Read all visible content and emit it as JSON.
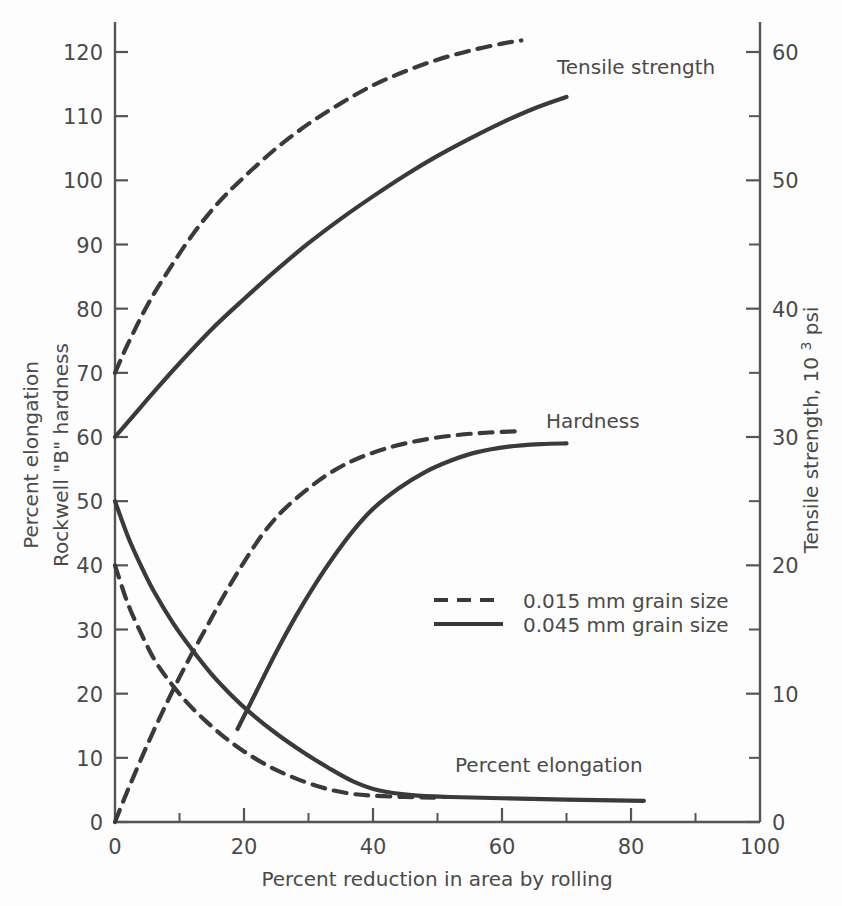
{
  "chart_data": {
    "type": "line",
    "title": "",
    "xlabel": "Percent reduction in area by rolling",
    "ylabel_left": "Percent elongation",
    "ylabel_left_2": "Rockwell \"B\" hardness",
    "ylabel_right": "Tensile strength,",
    "ylabel_right_unit_base": "10",
    "ylabel_right_unit_exp": "3",
    "ylabel_right_unit_tail": " psi",
    "xlim": [
      0,
      100
    ],
    "ylim_left": [
      0,
      124
    ],
    "ylim_right": [
      0,
      62
    ],
    "grid": false,
    "x_ticks": [
      0,
      20,
      40,
      60,
      80,
      100
    ],
    "x_minor_ticks": [
      10,
      30,
      50,
      70,
      90
    ],
    "y_ticks_left": [
      0,
      10,
      20,
      30,
      40,
      50,
      60,
      70,
      80,
      90,
      100,
      110,
      120
    ],
    "y_ticks_right": [
      0,
      10,
      20,
      30,
      40,
      50,
      60
    ],
    "y_minor_ticks_right": [
      5,
      15,
      25,
      35,
      45,
      55
    ],
    "legend_position": "center",
    "legend": [
      {
        "label": "0.015 mm grain size",
        "style": "dashed"
      },
      {
        "label": "0.045 mm grain size",
        "style": "solid"
      }
    ],
    "annotations": [
      {
        "text": "Tensile strength",
        "x": 63,
        "y": 117
      },
      {
        "text": "Hardness",
        "x": 66,
        "y": 62
      },
      {
        "text": "Percent elongation",
        "x": 53,
        "y": 8
      }
    ],
    "series": [
      {
        "name": "Tensile strength, 0.015 mm grain size",
        "style": "dashed",
        "axis": "left",
        "points": [
          [
            0,
            70
          ],
          [
            2,
            74.5
          ],
          [
            5,
            80.5
          ],
          [
            8,
            85.5
          ],
          [
            12,
            91.5
          ],
          [
            16,
            96.5
          ],
          [
            20,
            100.5
          ],
          [
            25,
            105.0
          ],
          [
            30,
            108.8
          ],
          [
            35,
            112.0
          ],
          [
            40,
            114.8
          ],
          [
            45,
            117.0
          ],
          [
            50,
            118.8
          ],
          [
            55,
            120.2
          ],
          [
            60,
            121.3
          ],
          [
            63,
            121.8
          ]
        ]
      },
      {
        "name": "Tensile strength, 0.045 mm grain size",
        "style": "solid",
        "axis": "left",
        "points": [
          [
            0,
            60
          ],
          [
            3,
            63.5
          ],
          [
            6,
            67.0
          ],
          [
            10,
            71.5
          ],
          [
            15,
            76.8
          ],
          [
            20,
            81.5
          ],
          [
            25,
            86.0
          ],
          [
            30,
            90.2
          ],
          [
            35,
            94.0
          ],
          [
            40,
            97.5
          ],
          [
            45,
            100.8
          ],
          [
            50,
            103.8
          ],
          [
            55,
            106.5
          ],
          [
            60,
            109.0
          ],
          [
            65,
            111.2
          ],
          [
            70,
            113.0
          ]
        ]
      },
      {
        "name": "Hardness, 0.015 mm grain size",
        "style": "dashed",
        "axis": "left",
        "points": [
          [
            0,
            0
          ],
          [
            2,
            5.0
          ],
          [
            5,
            12.0
          ],
          [
            8,
            18.5
          ],
          [
            11,
            24.5
          ],
          [
            14,
            30.0
          ],
          [
            17,
            35.5
          ],
          [
            20,
            40.5
          ],
          [
            23,
            45.0
          ],
          [
            26,
            48.5
          ],
          [
            30,
            52.0
          ],
          [
            34,
            54.8
          ],
          [
            38,
            56.8
          ],
          [
            43,
            58.5
          ],
          [
            48,
            59.6
          ],
          [
            53,
            60.3
          ],
          [
            58,
            60.7
          ],
          [
            63,
            60.9
          ]
        ]
      },
      {
        "name": "Hardness, 0.045 mm grain size",
        "style": "solid",
        "axis": "left",
        "points": [
          [
            19,
            14.5
          ],
          [
            22,
            20.5
          ],
          [
            25,
            26.5
          ],
          [
            28,
            32.0
          ],
          [
            31,
            37.0
          ],
          [
            34,
            41.5
          ],
          [
            37,
            45.5
          ],
          [
            40,
            48.8
          ],
          [
            44,
            52.0
          ],
          [
            48,
            54.5
          ],
          [
            52,
            56.3
          ],
          [
            56,
            57.6
          ],
          [
            61,
            58.5
          ],
          [
            66,
            58.9
          ],
          [
            70,
            59.0
          ]
        ]
      },
      {
        "name": "Percent elongation, 0.015 mm grain size",
        "style": "dashed",
        "axis": "left",
        "points": [
          [
            0,
            40
          ],
          [
            2,
            34.0
          ],
          [
            4,
            29.5
          ],
          [
            6,
            25.5
          ],
          [
            8,
            22.5
          ],
          [
            11,
            18.8
          ],
          [
            14,
            15.8
          ],
          [
            17,
            13.2
          ],
          [
            20,
            11.0
          ],
          [
            24,
            8.6
          ],
          [
            28,
            6.8
          ],
          [
            32,
            5.4
          ],
          [
            36,
            4.5
          ],
          [
            40,
            4.1
          ],
          [
            45,
            3.9
          ],
          [
            50,
            3.8
          ]
        ]
      },
      {
        "name": "Percent elongation, 0.045 mm grain size",
        "style": "solid",
        "axis": "left",
        "points": [
          [
            0,
            50
          ],
          [
            2,
            44.5
          ],
          [
            4,
            40.0
          ],
          [
            6,
            36.0
          ],
          [
            9,
            31.0
          ],
          [
            12,
            26.8
          ],
          [
            15,
            23.0
          ],
          [
            18,
            19.8
          ],
          [
            21,
            17.0
          ],
          [
            25,
            13.8
          ],
          [
            29,
            11.0
          ],
          [
            33,
            8.5
          ],
          [
            37,
            6.3
          ],
          [
            41,
            4.9
          ],
          [
            46,
            4.2
          ],
          [
            52,
            3.9
          ],
          [
            60,
            3.7
          ],
          [
            70,
            3.5
          ],
          [
            82,
            3.3
          ]
        ]
      }
    ]
  },
  "ticks": {
    "x": [
      "0",
      "20",
      "40",
      "60",
      "80",
      "100"
    ],
    "y_left": [
      "0",
      "10",
      "20",
      "30",
      "40",
      "50",
      "60",
      "70",
      "80",
      "90",
      "100",
      "110",
      "120"
    ],
    "y_right": [
      "0",
      "10",
      "20",
      "30",
      "40",
      "50",
      "60"
    ]
  },
  "labels": {
    "x_title": "Percent reduction in area by rolling",
    "y_left_line1": "Percent elongation",
    "y_left_line2": "Rockwell \"B\" hardness",
    "y_right_title": "Tensile strength,",
    "y_right_unit": " psi",
    "unit_base": "10",
    "unit_exp": "3",
    "tensile_label": "Tensile strength",
    "hardness_label": "Hardness",
    "elongation_label": "Percent elongation",
    "legend_dashed": "0.015 mm grain size",
    "legend_solid": "0.045 mm grain size"
  },
  "colors": {
    "ink": "#3a3a3a",
    "axis": "#555555",
    "background": "#fdfdfd"
  }
}
